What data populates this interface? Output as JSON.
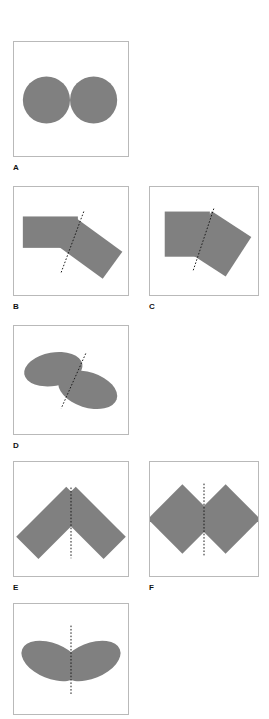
{
  "figure": {
    "caption_labels": [
      "A",
      "B",
      "C",
      "D",
      "E",
      "F"
    ],
    "shape_fill_color": "#808080",
    "panel_border_color": "#b9b9b9",
    "axis_line_color": "#1a1a1a",
    "background_color": "#ffffff"
  },
  "panels": [
    {
      "id": "A",
      "label": "A",
      "x": 13,
      "y": 41,
      "w": 116,
      "h": 116,
      "label_x": 13,
      "label_y": 163,
      "has_symmetry_line": false,
      "description": "two equal circles touching side by side",
      "shapes": [
        {
          "kind": "circle",
          "cx": 33,
          "cy": 59,
          "rx": 24,
          "ry": 24,
          "rotate": 0
        },
        {
          "kind": "circle",
          "cx": 81,
          "cy": 59,
          "rx": 24,
          "ry": 24,
          "rotate": 0
        }
      ],
      "symmetry_line": null
    },
    {
      "id": "B",
      "label": "B",
      "x": 13,
      "y": 186,
      "w": 116,
      "h": 110,
      "label_x": 13,
      "label_y": 302,
      "has_symmetry_line": true,
      "description": "horizontal rectangle abutting a rotated rectangle, dotted line at the join",
      "shapes": [
        {
          "kind": "rect",
          "cx": 37,
          "cy": 46,
          "w": 56,
          "h": 32,
          "rotate": 0
        },
        {
          "kind": "rect",
          "cx": 76,
          "cy": 62,
          "w": 60,
          "h": 34,
          "rotate": 36
        }
      ],
      "symmetry_line": {
        "x1": 71,
        "y1": 25,
        "x2": 48,
        "y2": 87
      }
    },
    {
      "id": "C",
      "label": "C",
      "x": 149,
      "y": 186,
      "w": 110,
      "h": 110,
      "label_x": 149,
      "label_y": 302,
      "has_symmetry_line": true,
      "description": "upright square abutting a rotated square, dotted line at the join",
      "shapes": [
        {
          "kind": "rect",
          "cx": 38,
          "cy": 48,
          "w": 46,
          "h": 46,
          "rotate": 0
        },
        {
          "kind": "rect",
          "cx": 70,
          "cy": 58,
          "w": 48,
          "h": 48,
          "rotate": 33
        }
      ],
      "symmetry_line": {
        "x1": 65,
        "y1": 22,
        "x2": 44,
        "y2": 85
      }
    },
    {
      "id": "D",
      "label": "D",
      "x": 13,
      "y": 325,
      "w": 116,
      "h": 110,
      "label_x": 13,
      "label_y": 441,
      "has_symmetry_line": true,
      "description": "two tilted ellipses meeting, dotted line at the join",
      "shapes": [
        {
          "kind": "ellipse",
          "cx": 40,
          "cy": 44,
          "rx": 30,
          "ry": 17,
          "rotate": -10
        },
        {
          "kind": "ellipse",
          "cx": 75,
          "cy": 65,
          "rx": 31,
          "ry": 18,
          "rotate": 18
        }
      ],
      "symmetry_line": {
        "x1": 73,
        "y1": 28,
        "x2": 48,
        "y2": 84
      }
    },
    {
      "id": "E",
      "label": "E",
      "x": 13,
      "y": 461,
      "w": 116,
      "h": 116,
      "label_x": 13,
      "label_y": 583,
      "has_symmetry_line": true,
      "description": "two mirrored tilted rectangles forming a chevron, vertical dotted axis",
      "shapes": [
        {
          "kind": "rect",
          "cx": 39,
          "cy": 62,
          "w": 72,
          "h": 32,
          "rotate": -45
        },
        {
          "kind": "rect",
          "cx": 77,
          "cy": 62,
          "w": 72,
          "h": 32,
          "rotate": 45
        }
      ],
      "symmetry_line": {
        "x1": 58,
        "y1": 26,
        "x2": 58,
        "y2": 98
      }
    },
    {
      "id": "F",
      "label": "F",
      "x": 149,
      "y": 461,
      "w": 110,
      "h": 116,
      "label_x": 149,
      "label_y": 583,
      "has_symmetry_line": true,
      "description": "two mirrored squares rotated 45 degrees meeting at the centre, vertical dotted axis",
      "shapes": [
        {
          "kind": "rect",
          "cx": 33,
          "cy": 58,
          "w": 50,
          "h": 50,
          "rotate": 45
        },
        {
          "kind": "rect",
          "cx": 77,
          "cy": 58,
          "w": 50,
          "h": 50,
          "rotate": 45
        }
      ],
      "symmetry_line": {
        "x1": 55,
        "y1": 22,
        "x2": 55,
        "y2": 95
      }
    },
    {
      "id": "G",
      "label": "",
      "x": 13,
      "y": 603,
      "w": 116,
      "h": 112,
      "label_x": 13,
      "label_y": 719,
      "has_symmetry_line": true,
      "description": "two mirrored tilted ellipses forming a butterfly shape, vertical dotted axis",
      "shapes": [
        {
          "kind": "ellipse",
          "cx": 38,
          "cy": 58,
          "rx": 32,
          "ry": 18,
          "rotate": 22
        },
        {
          "kind": "ellipse",
          "cx": 78,
          "cy": 58,
          "rx": 32,
          "ry": 18,
          "rotate": -22
        }
      ],
      "symmetry_line": {
        "x1": 58,
        "y1": 22,
        "x2": 58,
        "y2": 92
      }
    }
  ],
  "chart_data": {
    "type": "diagram",
    "title": "",
    "subtitle": "",
    "panel_count": 7,
    "labelled_panels": [
      "A",
      "B",
      "C",
      "D",
      "E",
      "F"
    ],
    "series": [
      {
        "name": "A",
        "shape_type": "circle",
        "shape_count": 2,
        "symmetry_axis": "none",
        "values": [
          24,
          24
        ]
      },
      {
        "name": "B",
        "shape_type": "rectangle",
        "shape_count": 2,
        "symmetry_axis": "oblique-dotted",
        "values": [
          0,
          36
        ]
      },
      {
        "name": "C",
        "shape_type": "square",
        "shape_count": 2,
        "symmetry_axis": "oblique-dotted",
        "values": [
          0,
          33
        ]
      },
      {
        "name": "D",
        "shape_type": "ellipse",
        "shape_count": 2,
        "symmetry_axis": "oblique-dotted",
        "values": [
          -10,
          18
        ]
      },
      {
        "name": "E",
        "shape_type": "rectangle",
        "shape_count": 2,
        "symmetry_axis": "vertical-dotted",
        "values": [
          -45,
          45
        ]
      },
      {
        "name": "F",
        "shape_type": "square",
        "shape_count": 2,
        "symmetry_axis": "vertical-dotted",
        "values": [
          45,
          45
        ]
      },
      {
        "name": "G",
        "shape_type": "ellipse",
        "shape_count": 2,
        "symmetry_axis": "vertical-dotted",
        "values": [
          22,
          -22
        ]
      }
    ],
    "xlabel": "",
    "ylabel": "",
    "legend_position": "none",
    "grid": false
  }
}
